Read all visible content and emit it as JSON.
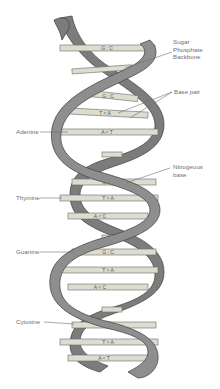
{
  "colors": {
    "backbone_fill": "#8a8a8a",
    "backbone_stroke": "#4a4a4a",
    "base_fill": "#dcdccf",
    "base_stroke": "#6a6a6a",
    "label_text": "#6f6f6f",
    "leader_line": "#6f6f6f"
  },
  "labels": {
    "right": [
      {
        "id": "sugar-phosphate-backbone",
        "lines": [
          "Sugar",
          "Phosphate",
          "Backbone"
        ]
      },
      {
        "id": "base-pair",
        "lines": [
          "Base pair"
        ]
      },
      {
        "id": "nitrogeous-base",
        "lines": [
          "Nitrogeous",
          "base"
        ]
      }
    ],
    "left": [
      {
        "id": "adenine",
        "text": "Adenine"
      },
      {
        "id": "thymine",
        "text": "Thymine"
      },
      {
        "id": "guanine",
        "text": "Guanine"
      },
      {
        "id": "cytosine",
        "text": "Cytosine"
      }
    ]
  },
  "base_pairs": [
    {
      "y": 48,
      "text": "G : C"
    },
    {
      "y": 70,
      "text": ""
    },
    {
      "y": 96,
      "text": "G : C"
    },
    {
      "y": 113,
      "text": "T < A"
    },
    {
      "y": 132,
      "text": "A < T"
    },
    {
      "y": 155,
      "text": ""
    },
    {
      "y": 182,
      "text": "G : C"
    },
    {
      "y": 198,
      "text": "T > A"
    },
    {
      "y": 216,
      "text": "A < C"
    },
    {
      "y": 238,
      "text": ""
    },
    {
      "y": 252,
      "text": "G : C"
    },
    {
      "y": 270,
      "text": "T > A"
    },
    {
      "y": 287,
      "text": "A < C"
    },
    {
      "y": 310,
      "text": ""
    },
    {
      "y": 325,
      "text": "C : G"
    },
    {
      "y": 342,
      "text": "T > A"
    },
    {
      "y": 358,
      "text": "A < T"
    }
  ]
}
